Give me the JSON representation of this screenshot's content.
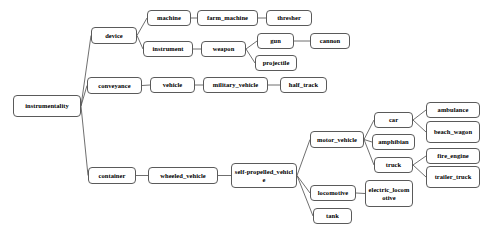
{
  "diagram": {
    "type": "tree",
    "orientation": "left-to-right",
    "node_shape": "rounded-rectangle",
    "colors": {
      "background": "#ffffff",
      "node_fill": "#ffffff",
      "node_border": "#5a5a5a",
      "edge": "#4a4a4a",
      "text": "#000000"
    },
    "nodes": [
      {
        "id": "instrumentality",
        "label": "instrumentality",
        "x": 13,
        "y": 95,
        "w": 68,
        "h": 22
      },
      {
        "id": "device",
        "label": "device",
        "x": 91,
        "y": 27,
        "w": 46,
        "h": 17
      },
      {
        "id": "conveyance",
        "label": "conveyance",
        "x": 87,
        "y": 77,
        "w": 55,
        "h": 17
      },
      {
        "id": "container",
        "label": "container",
        "x": 88,
        "y": 167,
        "w": 48,
        "h": 17
      },
      {
        "id": "machine",
        "label": "machine",
        "x": 147,
        "y": 10,
        "w": 44,
        "h": 16
      },
      {
        "id": "instrument",
        "label": "instrument",
        "x": 143,
        "y": 41,
        "w": 50,
        "h": 16
      },
      {
        "id": "farm_machine",
        "label": "farm_machine",
        "x": 197,
        "y": 10,
        "w": 61,
        "h": 16
      },
      {
        "id": "thresher",
        "label": "thresher",
        "x": 266,
        "y": 10,
        "w": 46,
        "h": 16
      },
      {
        "id": "weapon",
        "label": "weapon",
        "x": 201,
        "y": 41,
        "w": 45,
        "h": 16
      },
      {
        "id": "gun",
        "label": "gun",
        "x": 257,
        "y": 33,
        "w": 37,
        "h": 16
      },
      {
        "id": "cannon",
        "label": "cannon",
        "x": 310,
        "y": 33,
        "w": 40,
        "h": 16
      },
      {
        "id": "projectile",
        "label": "projectile",
        "x": 255,
        "y": 55,
        "w": 42,
        "h": 16
      },
      {
        "id": "vehicle",
        "label": "vehicle",
        "x": 150,
        "y": 77,
        "w": 45,
        "h": 16
      },
      {
        "id": "military_vehicle",
        "label": "military_vehicle",
        "x": 203,
        "y": 77,
        "w": 65,
        "h": 16
      },
      {
        "id": "half_track",
        "label": "half_track",
        "x": 280,
        "y": 77,
        "w": 47,
        "h": 16
      },
      {
        "id": "wheeled_vehicle",
        "label": "wheeled_vehicle",
        "x": 148,
        "y": 167,
        "w": 70,
        "h": 17
      },
      {
        "id": "self_propelled_vehicle",
        "label": "self-propelled_vehicle",
        "x": 231,
        "y": 163,
        "w": 66,
        "h": 25
      },
      {
        "id": "motor_vehicle",
        "label": "motor_vehicle",
        "x": 310,
        "y": 131,
        "w": 54,
        "h": 17
      },
      {
        "id": "locomotive",
        "label": "locomotive",
        "x": 310,
        "y": 185,
        "w": 46,
        "h": 16
      },
      {
        "id": "tank",
        "label": "tank",
        "x": 313,
        "y": 208,
        "w": 39,
        "h": 16
      },
      {
        "id": "car",
        "label": "car",
        "x": 374,
        "y": 112,
        "w": 39,
        "h": 16
      },
      {
        "id": "amphibian",
        "label": "amphibian",
        "x": 372,
        "y": 134,
        "w": 43,
        "h": 16
      },
      {
        "id": "truck",
        "label": "truck",
        "x": 374,
        "y": 157,
        "w": 39,
        "h": 16
      },
      {
        "id": "electric_locomotive",
        "label": "electric_locomotive",
        "x": 365,
        "y": 180,
        "w": 48,
        "h": 27
      },
      {
        "id": "ambulance",
        "label": "ambulance",
        "x": 426,
        "y": 102,
        "w": 54,
        "h": 16
      },
      {
        "id": "beach_wagon",
        "label": "beach_wagon",
        "x": 426,
        "y": 121,
        "w": 54,
        "h": 22
      },
      {
        "id": "fire_engine",
        "label": "fire_engine",
        "x": 426,
        "y": 148,
        "w": 54,
        "h": 16
      },
      {
        "id": "trailer_truck",
        "label": "trailer_truck",
        "x": 426,
        "y": 166,
        "w": 54,
        "h": 22
      }
    ],
    "edges": [
      {
        "from": "instrumentality",
        "to": "device"
      },
      {
        "from": "instrumentality",
        "to": "conveyance"
      },
      {
        "from": "instrumentality",
        "to": "container"
      },
      {
        "from": "device",
        "to": "machine"
      },
      {
        "from": "device",
        "to": "instrument"
      },
      {
        "from": "machine",
        "to": "farm_machine"
      },
      {
        "from": "farm_machine",
        "to": "thresher"
      },
      {
        "from": "instrument",
        "to": "weapon"
      },
      {
        "from": "weapon",
        "to": "gun"
      },
      {
        "from": "weapon",
        "to": "projectile"
      },
      {
        "from": "gun",
        "to": "cannon"
      },
      {
        "from": "conveyance",
        "to": "vehicle"
      },
      {
        "from": "vehicle",
        "to": "military_vehicle"
      },
      {
        "from": "military_vehicle",
        "to": "half_track"
      },
      {
        "from": "container",
        "to": "wheeled_vehicle"
      },
      {
        "from": "wheeled_vehicle",
        "to": "self_propelled_vehicle"
      },
      {
        "from": "self_propelled_vehicle",
        "to": "motor_vehicle"
      },
      {
        "from": "self_propelled_vehicle",
        "to": "locomotive"
      },
      {
        "from": "self_propelled_vehicle",
        "to": "tank"
      },
      {
        "from": "motor_vehicle",
        "to": "car"
      },
      {
        "from": "motor_vehicle",
        "to": "amphibian"
      },
      {
        "from": "motor_vehicle",
        "to": "truck"
      },
      {
        "from": "car",
        "to": "ambulance"
      },
      {
        "from": "car",
        "to": "beach_wagon"
      },
      {
        "from": "truck",
        "to": "fire_engine"
      },
      {
        "from": "truck",
        "to": "trailer_truck"
      },
      {
        "from": "locomotive",
        "to": "electric_locomotive"
      }
    ]
  }
}
